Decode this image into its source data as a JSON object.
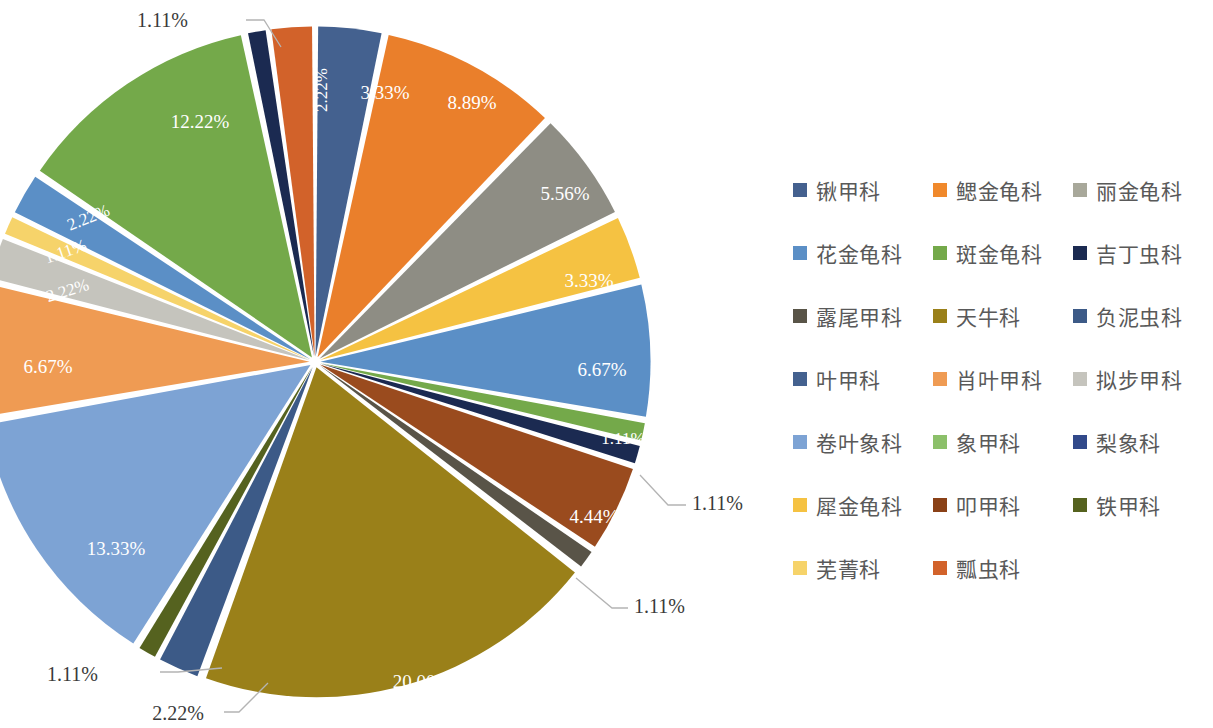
{
  "chart_data": {
    "type": "pie",
    "title": "",
    "legend_position": "right",
    "value_format": "percent",
    "donut_hole": false,
    "exploded": true,
    "start_angle_deg": 0,
    "direction": "clockwise",
    "total": "100.00%",
    "categories": [
      "锹甲科",
      "鳃金龟科",
      "丽金龟科",
      "花金龟科",
      "斑金龟科",
      "吉丁虫科",
      "露尾甲科",
      "天牛科",
      "负泥虫科",
      "叶甲科",
      "肖叶甲科",
      "拟步甲科",
      "卷叶象科",
      "象甲科",
      "梨象科",
      "犀金龟科",
      "叩甲科",
      "铁甲科",
      "芜菁科",
      "瓢虫科"
    ],
    "values": [
      3.33,
      8.89,
      5.56,
      3.33,
      6.67,
      1.11,
      1.11,
      4.44,
      1.11,
      20.0,
      2.22,
      1.11,
      13.33,
      6.67,
      2.22,
      1.11,
      2.22,
      12.22,
      1.11,
      2.22
    ],
    "labels": [
      "3.33%",
      "8.89%",
      "5.56%",
      "3.33%",
      "6.67%",
      "1.11%",
      "1.11%",
      "4.44%",
      "1.11%",
      "20.00%",
      "2.22%",
      "1.11%",
      "13.33%",
      "6.67%",
      "2.22%",
      "1.11%",
      "2.22%",
      "12.22%",
      "1.11%",
      "2.22%"
    ],
    "colors": [
      "#44618f",
      "#ea7f2b",
      "#8e8d84",
      "#5b8fc6",
      "#74a94a",
      "#1b2a51",
      "#595448",
      "#9a801d",
      "#3c5a87",
      "#9a8019",
      "#ef9b53",
      "#c5c4bd",
      "#7da3d4",
      "#8cc06a",
      "#32498a",
      "#f5c242",
      "#8a4117",
      "#55621f",
      "#f6d36a",
      "#d2622a"
    ],
    "series_name": "科",
    "legend_columns": 3
  },
  "slices": [
    {
      "name": "锹甲科",
      "label": "3.33%",
      "color": "#44618f",
      "label_kind": "inside",
      "label_x": 385,
      "label_y": 95,
      "rot": 0
    },
    {
      "name": "鳃金龟科",
      "label": "8.89%",
      "color": "#ea7f2b",
      "label_kind": "inside",
      "label_x": 472,
      "label_y": 105,
      "rot": 0
    },
    {
      "name": "丽金龟科",
      "label": "5.56%",
      "color": "#8e8d84",
      "label_kind": "inside",
      "label_x": 565,
      "label_y": 196,
      "rot": 0
    },
    {
      "name": "花金龟科",
      "label": "3.33%",
      "color": "#f5c242",
      "label_kind": "inside",
      "label_x": 589,
      "label_y": 283,
      "rot": 0
    },
    {
      "name": "斑金龟科",
      "label": "6.67%",
      "color": "#5b8fc6",
      "label_kind": "inside",
      "label_x": 602,
      "label_y": 372,
      "rot": 0
    },
    {
      "name": "吉丁虫科",
      "label": "1.11%",
      "color": "#74a94a",
      "label_kind": "inside",
      "label_x": 623,
      "label_y": 440,
      "rot": 0
    },
    {
      "name": "露尾甲科",
      "label": "1.11%",
      "color": "#1b2a51",
      "label_kind": "callout",
      "label_x": 692,
      "label_y": 505,
      "lx1": 640,
      "ly1": 475,
      "lx2": 668,
      "ly2": 505,
      "lx3": 686,
      "ly3": 505
    },
    {
      "name": "天牛科",
      "label": "4.44%",
      "color": "#9a4b1e",
      "label_kind": "inside",
      "label_x": 594,
      "label_y": 519,
      "rot": 0
    },
    {
      "name": "负泥虫科",
      "label": "1.11%",
      "color": "#595448",
      "label_kind": "callout",
      "label_x": 634,
      "label_y": 608,
      "lx1": 576,
      "ly1": 578,
      "lx2": 612,
      "ly2": 608,
      "lx3": 628,
      "ly3": 608
    },
    {
      "name": "叶甲科",
      "label": "20.00%",
      "color": "#9a8019",
      "label_kind": "inside",
      "label_x": 422,
      "label_y": 684,
      "rot": 0
    },
    {
      "name": "肖叶甲科",
      "label": "2.22%",
      "color": "#3c5a87",
      "label_kind": "callout",
      "label_x": 204,
      "label_y": 715,
      "lx1": 268,
      "ly1": 683,
      "lx2": 239,
      "ly2": 712,
      "lx3": 224,
      "ly3": 712
    },
    {
      "name": "拟步甲科",
      "label": "1.11%",
      "color": "#55621f",
      "label_kind": "callout",
      "label_x": 98,
      "label_y": 676,
      "lx1": 222,
      "ly1": 668,
      "lx2": 178,
      "ly2": 672,
      "lx3": 160,
      "ly3": 672
    },
    {
      "name": "卷叶象科",
      "label": "13.33%",
      "color": "#7da3d4",
      "label_kind": "inside",
      "label_x": 116,
      "label_y": 551,
      "rot": 0
    },
    {
      "name": "象甲科",
      "label": "6.67%",
      "color": "#ef9b53",
      "label_kind": "inside",
      "label_x": 48,
      "label_y": 369,
      "rot": 0
    },
    {
      "name": "梨象科",
      "label": "2.22%",
      "color": "#c5c4bd",
      "label_kind": "inside",
      "label_x": 68,
      "label_y": 292,
      "rot": -17
    },
    {
      "name": "犀金龟科",
      "label": "1.11%",
      "color": "#f6d36a",
      "label_kind": "inside",
      "label_x": 66,
      "label_y": 253,
      "rot": -19
    },
    {
      "name": "叩甲科",
      "label": "2.22%",
      "color": "#5b8fc6",
      "label_kind": "inside",
      "label_x": 89,
      "label_y": 219,
      "rot": -22
    },
    {
      "name": "铁甲科",
      "label": "12.22%",
      "color": "#74a94a",
      "label_kind": "inside",
      "label_x": 200,
      "label_y": 124,
      "rot": 0
    },
    {
      "name": "芜菁科",
      "label": "1.11%",
      "color": "#1b2a51",
      "label_kind": "callout",
      "label_x": 188,
      "label_y": 22,
      "lx1": 281,
      "ly1": 47,
      "lx2": 264,
      "ly2": 20,
      "lx3": 246,
      "ly3": 20
    },
    {
      "name": "瓢虫科",
      "label": "2.22%",
      "color": "#d2622a",
      "label_kind": "inside",
      "label_x": 323,
      "label_y": 90,
      "rot": -90
    }
  ],
  "legend": {
    "columns": 3,
    "items": [
      {
        "label": "锹甲科",
        "color": "#44618f"
      },
      {
        "label": "鳃金龟科",
        "color": "#f0892c"
      },
      {
        "label": "丽金龟科",
        "color": "#a8a89a"
      },
      {
        "label": "花金龟科",
        "color": "#5b8fc6"
      },
      {
        "label": "斑金龟科",
        "color": "#74a94a"
      },
      {
        "label": "吉丁虫科",
        "color": "#1b2a51"
      },
      {
        "label": "露尾甲科",
        "color": "#595448"
      },
      {
        "label": "天牛科",
        "color": "#9a8019"
      },
      {
        "label": "负泥虫科",
        "color": "#3c5a87"
      },
      {
        "label": "叶甲科",
        "color": "#44618f"
      },
      {
        "label": "肖叶甲科",
        "color": "#ef9b53"
      },
      {
        "label": "拟步甲科",
        "color": "#c5c4bd"
      },
      {
        "label": "卷叶象科",
        "color": "#7da3d4"
      },
      {
        "label": "象甲科",
        "color": "#8cc06a"
      },
      {
        "label": "梨象科",
        "color": "#32498a"
      },
      {
        "label": "犀金龟科",
        "color": "#f5c242"
      },
      {
        "label": "叩甲科",
        "color": "#8a4117"
      },
      {
        "label": "铁甲科",
        "color": "#55621f"
      },
      {
        "label": "芜菁科",
        "color": "#f6d36a"
      },
      {
        "label": "瓢虫科",
        "color": "#d2622a"
      }
    ]
  }
}
